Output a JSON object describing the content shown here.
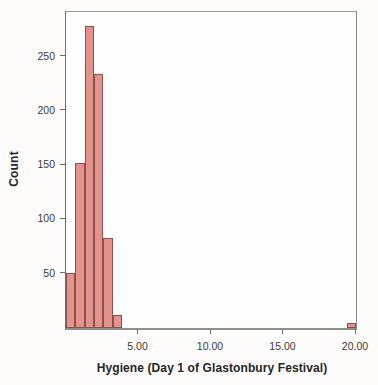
{
  "chart_data": {
    "type": "bar",
    "subtype": "histogram",
    "title": "",
    "xlabel": "Hygiene (Day 1 of Glastonbury Festival)",
    "ylabel": "Count",
    "xlim": [
      0,
      20
    ],
    "ylim": [
      0,
      291
    ],
    "grid": false,
    "legend": "none",
    "bin_width": 0.645,
    "x_ticks": [
      {
        "value": 5,
        "label": "5.00"
      },
      {
        "value": 10,
        "label": "10.00"
      },
      {
        "value": 15,
        "label": "15.00"
      },
      {
        "value": 20,
        "label": "20.00"
      }
    ],
    "y_ticks": [
      {
        "value": 50,
        "label": "50"
      },
      {
        "value": 100,
        "label": "100"
      },
      {
        "value": 150,
        "label": "150"
      },
      {
        "value": 200,
        "label": "200"
      },
      {
        "value": 250,
        "label": "250"
      }
    ],
    "bins": [
      {
        "start": 0.0,
        "end": 0.645,
        "count": 51
      },
      {
        "start": 0.645,
        "end": 1.29,
        "count": 152
      },
      {
        "start": 1.29,
        "end": 1.935,
        "count": 278
      },
      {
        "start": 1.935,
        "end": 2.58,
        "count": 234
      },
      {
        "start": 2.58,
        "end": 3.225,
        "count": 83
      },
      {
        "start": 3.225,
        "end": 3.87,
        "count": 12
      },
      {
        "start": 19.355,
        "end": 20.0,
        "count": 5
      }
    ],
    "colors": {
      "bar_fill": "#e5928b",
      "bar_border": "#84534d",
      "plot_border": "#8f8f8f",
      "axis_line": "#6e6e6e",
      "tick_label": "#3a3a3a",
      "axis_title": "#262626",
      "background": "#fdfcfa",
      "plot_background": "#fefefe"
    }
  }
}
